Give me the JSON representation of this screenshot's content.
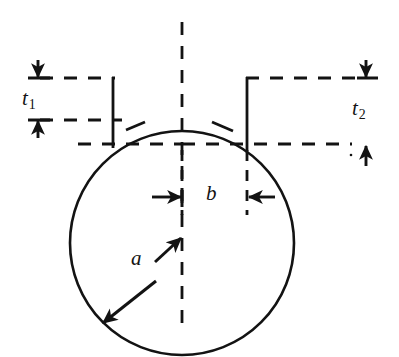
{
  "figure": {
    "type": "engineering-cross-section-diagram",
    "background_color": "#ffffff",
    "line_color": "#131313"
  },
  "labels": {
    "t1": {
      "symbol": "t",
      "subscript": "1",
      "meaning": "left wall thickness"
    },
    "t2": {
      "symbol": "t",
      "subscript": "2",
      "meaning": "right wall thickness"
    },
    "a": {
      "symbol": "a",
      "meaning": "circle radius"
    },
    "b": {
      "symbol": "b",
      "meaning": "neck half-width / gap"
    }
  },
  "geometry": {
    "circle": {
      "cx": 182,
      "cy": 243,
      "r": 112,
      "style": "solid"
    },
    "vertical_centerline": {
      "x": 182,
      "y_top": 22,
      "y_bottom": 330,
      "style": "dashed"
    },
    "horizontal_centerline": {
      "y": 144,
      "x_left": 78,
      "x_right": 382,
      "style": "dashed"
    },
    "neck_wall_left": {
      "x": 113,
      "y_top": 78,
      "y_bottom": 148,
      "style": "solid"
    },
    "neck_wall_right": {
      "x": 247,
      "y_top": 78,
      "y_bottom": 150,
      "style": "solid"
    },
    "dim_line_top": {
      "y": 78,
      "style": "dashed"
    },
    "dim_line_t1_bottom": {
      "y": 120,
      "style": "dashed"
    }
  },
  "dimensions": [
    {
      "name": "t1",
      "orientation": "vertical",
      "from_y": 78,
      "to_y": 120,
      "at_x": 38,
      "arrowheads": "both-inward"
    },
    {
      "name": "t2",
      "orientation": "vertical",
      "from_y": 78,
      "to_y": 144,
      "at_x": 366,
      "arrowheads": "both-inward"
    },
    {
      "name": "b",
      "orientation": "horizontal",
      "from_x": 182,
      "to_x": 247,
      "at_y": 197,
      "arrowheads": "both-inward"
    },
    {
      "name": "a",
      "orientation": "radial",
      "from_x": 182,
      "from_y": 243,
      "to_x": 103,
      "to_y": 323,
      "arrowheads": "both"
    }
  ]
}
